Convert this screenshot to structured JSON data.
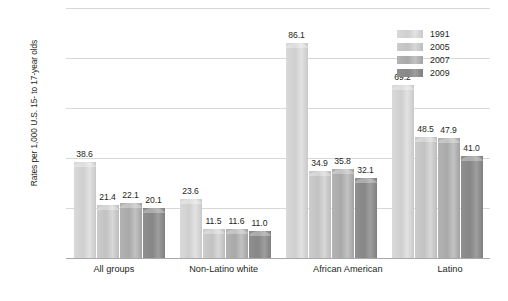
{
  "chart_data": {
    "type": "bar",
    "title": "",
    "xlabel": "",
    "ylabel": "Rates per 1,000 U.S. 15- to 17-year olds",
    "ylim": [
      0,
      100
    ],
    "yticks": [
      0,
      20,
      40,
      60,
      80,
      100
    ],
    "ytick_labels": [
      "0",
      "20",
      "40",
      "60",
      "80",
      "100"
    ],
    "grid": true,
    "legend_position": "top-right",
    "categories": [
      "All groups",
      "Non-Latino white",
      "African American",
      "Latino"
    ],
    "series": [
      {
        "name": "1991",
        "color": "#d4d4d4",
        "values": [
          38.6,
          23.6,
          86.1,
          69.2
        ]
      },
      {
        "name": "2005",
        "color": "#c6c6c6",
        "values": [
          21.4,
          11.5,
          34.9,
          48.5
        ]
      },
      {
        "name": "2007",
        "color": "#aeaeae",
        "values": [
          22.1,
          11.6,
          35.8,
          47.9
        ]
      },
      {
        "name": "2009",
        "color": "#8a8a8a",
        "values": [
          20.1,
          11.0,
          32.1,
          41.0
        ]
      }
    ],
    "value_labels": [
      [
        "38.6",
        "21.4",
        "22.1",
        "20.1"
      ],
      [
        "23.6",
        "11.5",
        "11.6",
        "11.0"
      ],
      [
        "86.1",
        "34.9",
        "35.8",
        "32.1"
      ],
      [
        "69.2",
        "48.5",
        "47.9",
        "41.0"
      ]
    ]
  }
}
